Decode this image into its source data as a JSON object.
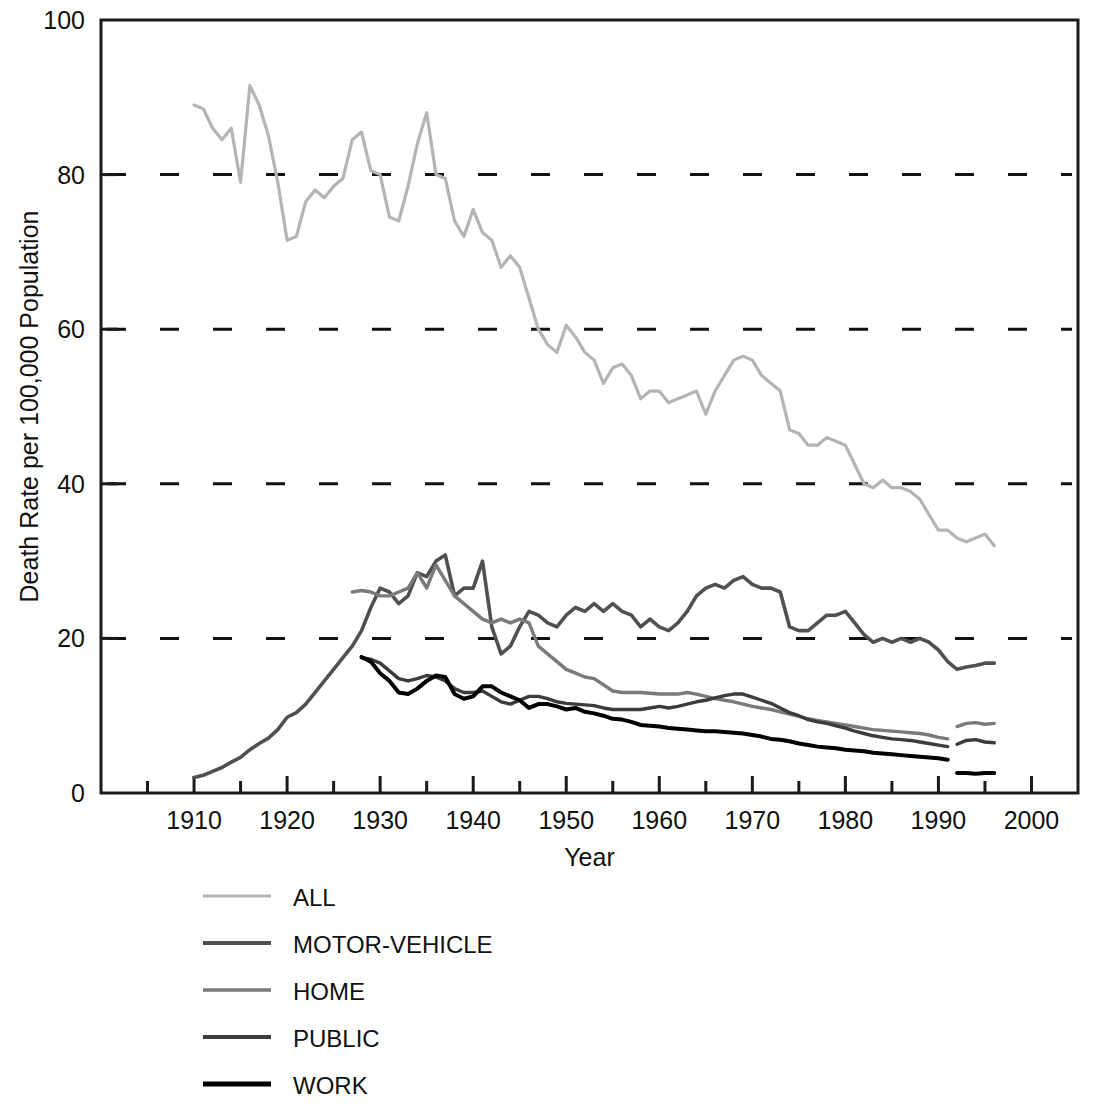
{
  "chart_data": {
    "type": "line",
    "title": "",
    "xlabel": "Year",
    "ylabel": "Death Rate per 100,000 Population",
    "xlim": [
      1900,
      2005
    ],
    "ylim": [
      0,
      100
    ],
    "xticks_major": [
      1910,
      1920,
      1930,
      1940,
      1950,
      1960,
      1970,
      1980,
      1990,
      2000
    ],
    "xticks_minor": [
      1905,
      1915,
      1925,
      1935,
      1945,
      1955,
      1965,
      1975,
      1985,
      1995
    ],
    "yticks": [
      0,
      20,
      40,
      60,
      80,
      100
    ],
    "grid": "horizontal-dashed",
    "legend_position": "below-left",
    "series": [
      {
        "name": "ALL",
        "color": "#b4b4b4",
        "width": 3.2,
        "x": [
          1910,
          1911,
          1912,
          1913,
          1914,
          1915,
          1916,
          1917,
          1918,
          1919,
          1920,
          1921,
          1922,
          1923,
          1924,
          1925,
          1926,
          1927,
          1928,
          1929,
          1930,
          1931,
          1932,
          1933,
          1934,
          1935,
          1936,
          1937,
          1938,
          1939,
          1940,
          1941,
          1942,
          1943,
          1944,
          1945,
          1946,
          1947,
          1948,
          1949,
          1950,
          1951,
          1952,
          1953,
          1954,
          1955,
          1956,
          1957,
          1958,
          1959,
          1960,
          1961,
          1962,
          1963,
          1964,
          1965,
          1966,
          1967,
          1968,
          1969,
          1970,
          1971,
          1972,
          1973,
          1974,
          1975,
          1976,
          1977,
          1978,
          1979,
          1980,
          1981,
          1982,
          1983,
          1984,
          1985,
          1986,
          1987,
          1988,
          1989,
          1990,
          1991,
          1992,
          1993,
          1994,
          1995,
          1996
        ],
        "y": [
          89.0,
          88.5,
          86.0,
          84.5,
          86.0,
          79.0,
          91.5,
          89.0,
          85.0,
          79.0,
          71.5,
          72.0,
          76.5,
          78.0,
          77.0,
          78.5,
          79.5,
          84.5,
          85.5,
          80.5,
          80.0,
          74.5,
          74.0,
          78.5,
          84.0,
          88.0,
          80.0,
          79.5,
          74.0,
          72.0,
          75.5,
          72.5,
          71.5,
          68.0,
          69.5,
          68.0,
          64.0,
          60.0,
          58.0,
          57.0,
          60.5,
          59.0,
          57.0,
          56.0,
          53.0,
          55.0,
          55.5,
          54.0,
          51.0,
          52.0,
          52.0,
          50.5,
          51.0,
          51.5,
          52.0,
          49.0,
          52.0,
          54.0,
          56.0,
          56.5,
          56.0,
          54.0,
          53.0,
          52.0,
          47.0,
          46.5,
          45.0,
          45.0,
          46.0,
          45.5,
          45.0,
          42.5,
          40.0,
          39.5,
          40.5,
          39.5,
          39.5,
          39.0,
          38.0,
          36.0,
          34.0,
          34.0,
          33.0,
          32.5,
          33.0,
          33.5,
          32.0
        ]
      },
      {
        "name": "MOTOR-VEHICLE",
        "color": "#505050",
        "width": 3.6,
        "x": [
          1910,
          1911,
          1912,
          1913,
          1914,
          1915,
          1916,
          1917,
          1918,
          1919,
          1920,
          1921,
          1922,
          1923,
          1924,
          1925,
          1926,
          1927,
          1928,
          1929,
          1930,
          1931,
          1932,
          1933,
          1934,
          1935,
          1936,
          1937,
          1938,
          1939,
          1940,
          1941,
          1942,
          1943,
          1944,
          1945,
          1946,
          1947,
          1948,
          1949,
          1950,
          1951,
          1952,
          1953,
          1954,
          1955,
          1956,
          1957,
          1958,
          1959,
          1960,
          1961,
          1962,
          1963,
          1964,
          1965,
          1966,
          1967,
          1968,
          1969,
          1970,
          1971,
          1972,
          1973,
          1974,
          1975,
          1976,
          1977,
          1978,
          1979,
          1980,
          1981,
          1982,
          1983,
          1984,
          1985,
          1986,
          1987,
          1988,
          1989,
          1990,
          1991,
          1992,
          1993,
          1994,
          1995,
          1996
        ],
        "y": [
          2.0,
          2.3,
          2.8,
          3.3,
          4.0,
          4.6,
          5.6,
          6.4,
          7.1,
          8.2,
          9.8,
          10.4,
          11.5,
          13.0,
          14.5,
          16.0,
          17.5,
          19.0,
          21.0,
          24.0,
          26.5,
          26.0,
          24.5,
          25.5,
          28.5,
          28.0,
          30.0,
          30.8,
          25.5,
          26.5,
          26.5,
          30.0,
          21.5,
          18.0,
          19.0,
          21.5,
          23.5,
          23.0,
          22.0,
          21.5,
          23.0,
          24.0,
          23.5,
          24.5,
          23.5,
          24.5,
          23.5,
          23.0,
          21.5,
          22.5,
          21.5,
          21.0,
          22.0,
          23.5,
          25.5,
          26.5,
          27.0,
          26.5,
          27.5,
          28.0,
          27.0,
          26.5,
          26.5,
          26.0,
          21.5,
          21.0,
          21.0,
          22.0,
          23.0,
          23.0,
          23.5,
          22.0,
          20.5,
          19.5,
          20.0,
          19.5,
          20.0,
          19.5,
          20.0,
          19.5,
          18.5,
          17.0,
          16.0,
          16.3,
          16.5,
          16.8,
          16.8
        ]
      },
      {
        "name": "HOME",
        "color": "#7a7a7a",
        "width": 3.4,
        "x": [
          1927,
          1928,
          1929,
          1930,
          1931,
          1932,
          1933,
          1934,
          1935,
          1936,
          1937,
          1938,
          1939,
          1940,
          1941,
          1942,
          1943,
          1944,
          1945,
          1946,
          1947,
          1948,
          1949,
          1950,
          1951,
          1952,
          1953,
          1954,
          1955,
          1956,
          1957,
          1958,
          1959,
          1960,
          1961,
          1962,
          1963,
          1964,
          1965,
          1966,
          1967,
          1968,
          1969,
          1970,
          1971,
          1972,
          1973,
          1974,
          1975,
          1976,
          1977,
          1978,
          1979,
          1980,
          1981,
          1982,
          1983,
          1984,
          1985,
          1986,
          1987,
          1988,
          1989,
          1990,
          1991
        ],
        "y": [
          26.0,
          26.2,
          26.0,
          25.5,
          25.5,
          26.0,
          26.5,
          28.5,
          26.5,
          29.5,
          27.5,
          25.5,
          24.5,
          23.5,
          22.5,
          22.0,
          22.5,
          22.0,
          22.5,
          22.0,
          19.0,
          18.0,
          17.0,
          16.0,
          15.5,
          15.0,
          14.8,
          14.0,
          13.2,
          13.0,
          13.0,
          13.0,
          12.9,
          12.8,
          12.8,
          12.8,
          13.0,
          12.8,
          12.5,
          12.2,
          12.0,
          11.8,
          11.5,
          11.2,
          11.0,
          10.8,
          10.5,
          10.2,
          9.9,
          9.6,
          9.4,
          9.2,
          9.0,
          8.8,
          8.6,
          8.4,
          8.2,
          8.1,
          8.0,
          7.9,
          7.8,
          7.7,
          7.5,
          7.2,
          7.0
        ]
      },
      {
        "name": "HOME (revised)",
        "color": "#7a7a7a",
        "width": 3.4,
        "x": [
          1992,
          1993,
          1994,
          1995,
          1996
        ],
        "y": [
          8.6,
          9.0,
          9.1,
          8.9,
          9.0
        ]
      },
      {
        "name": "PUBLIC",
        "color": "#3c3c3c",
        "width": 3.4,
        "x": [
          1928,
          1929,
          1930,
          1931,
          1932,
          1933,
          1934,
          1935,
          1936,
          1937,
          1938,
          1939,
          1940,
          1941,
          1942,
          1943,
          1944,
          1945,
          1946,
          1947,
          1948,
          1949,
          1950,
          1951,
          1952,
          1953,
          1954,
          1955,
          1956,
          1957,
          1958,
          1959,
          1960,
          1961,
          1962,
          1963,
          1964,
          1965,
          1966,
          1967,
          1968,
          1969,
          1970,
          1971,
          1972,
          1973,
          1974,
          1975,
          1976,
          1977,
          1978,
          1979,
          1980,
          1981,
          1982,
          1983,
          1984,
          1985,
          1986,
          1987,
          1988,
          1989,
          1990,
          1991
        ],
        "y": [
          17.5,
          17.3,
          16.8,
          15.8,
          14.8,
          14.5,
          14.8,
          15.2,
          15.0,
          14.5,
          13.5,
          13.0,
          13.0,
          13.2,
          12.5,
          11.8,
          11.5,
          12.0,
          12.5,
          12.5,
          12.2,
          11.8,
          11.6,
          11.5,
          11.4,
          11.3,
          11.0,
          10.8,
          10.8,
          10.8,
          10.8,
          11.0,
          11.2,
          11.0,
          11.2,
          11.5,
          11.8,
          12.0,
          12.3,
          12.6,
          12.8,
          12.8,
          12.4,
          12.0,
          11.6,
          11.0,
          10.4,
          10.0,
          9.5,
          9.2,
          9.0,
          8.7,
          8.4,
          8.0,
          7.7,
          7.4,
          7.2,
          7.0,
          6.9,
          6.8,
          6.6,
          6.4,
          6.2,
          6.0
        ]
      },
      {
        "name": "PUBLIC (revised)",
        "color": "#3c3c3c",
        "width": 3.4,
        "x": [
          1992,
          1993,
          1994,
          1995,
          1996
        ],
        "y": [
          6.3,
          6.8,
          6.9,
          6.6,
          6.5
        ]
      },
      {
        "name": "WORK",
        "color": "#000000",
        "width": 4.0,
        "x": [
          1928,
          1929,
          1930,
          1931,
          1932,
          1933,
          1934,
          1935,
          1936,
          1937,
          1938,
          1939,
          1940,
          1941,
          1942,
          1943,
          1944,
          1945,
          1946,
          1947,
          1948,
          1949,
          1950,
          1951,
          1952,
          1953,
          1954,
          1955,
          1956,
          1957,
          1958,
          1959,
          1960,
          1961,
          1962,
          1963,
          1964,
          1965,
          1966,
          1967,
          1968,
          1969,
          1970,
          1971,
          1972,
          1973,
          1974,
          1975,
          1976,
          1977,
          1978,
          1979,
          1980,
          1981,
          1982,
          1983,
          1984,
          1985,
          1986,
          1987,
          1988,
          1989,
          1990,
          1991
        ],
        "y": [
          17.6,
          17.0,
          15.5,
          14.5,
          13.0,
          12.8,
          13.5,
          14.5,
          15.2,
          15.0,
          12.8,
          12.2,
          12.5,
          13.8,
          13.8,
          13.0,
          12.5,
          12.0,
          11.0,
          11.5,
          11.5,
          11.2,
          10.8,
          11.0,
          10.5,
          10.3,
          10.0,
          9.6,
          9.5,
          9.2,
          8.8,
          8.7,
          8.6,
          8.4,
          8.3,
          8.2,
          8.1,
          8.0,
          8.0,
          7.9,
          7.8,
          7.7,
          7.5,
          7.3,
          7.0,
          6.9,
          6.7,
          6.4,
          6.2,
          6.0,
          5.9,
          5.8,
          5.6,
          5.5,
          5.4,
          5.2,
          5.1,
          5.0,
          4.9,
          4.8,
          4.7,
          4.6,
          4.5,
          4.3
        ]
      },
      {
        "name": "WORK (revised)",
        "color": "#000000",
        "width": 4.0,
        "x": [
          1992,
          1993,
          1994,
          1995,
          1996
        ],
        "y": [
          2.6,
          2.6,
          2.5,
          2.6,
          2.6
        ]
      }
    ],
    "legend": [
      {
        "label": "ALL",
        "color": "#b4b4b4",
        "width": 3.2
      },
      {
        "label": "MOTOR-VEHICLE",
        "color": "#505050",
        "width": 4.2
      },
      {
        "label": "HOME",
        "color": "#7a7a7a",
        "width": 3.6
      },
      {
        "label": "PUBLIC",
        "color": "#3c3c3c",
        "width": 4.0
      },
      {
        "label": "WORK",
        "color": "#000000",
        "width": 5.0
      }
    ]
  }
}
